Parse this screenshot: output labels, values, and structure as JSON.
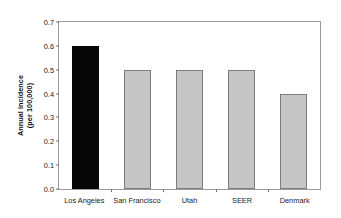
{
  "chart_data": {
    "type": "bar",
    "title": "",
    "xlabel": "",
    "ylabel": "Annual incidence (per 100,000)",
    "ylabel_line1": "Annual incidence",
    "ylabel_line2": "(per 100,000)",
    "categories": [
      "Los Angeles",
      "San Francisco",
      "Utah",
      "SEER",
      "Denmark"
    ],
    "values": [
      0.6,
      0.5,
      0.5,
      0.5,
      0.4
    ],
    "bar_colors": [
      "#070707",
      "#c6c6c6",
      "#c6c6c6",
      "#c6c6c6",
      "#c6c6c6"
    ],
    "ylim": [
      0.0,
      0.7
    ],
    "ytick_values": [
      0.0,
      0.1,
      0.2,
      0.3,
      0.4,
      0.5,
      0.6,
      0.7
    ],
    "ytick_labels": [
      "0.0",
      "0.1",
      "0.2",
      "0.3",
      "0.4",
      "0.5",
      "0.6",
      "0.7"
    ],
    "grid": false,
    "legend": false,
    "legend_position": "none",
    "frame_color": "#9a9a9a",
    "highlight_color": "#070707",
    "series_color": "#c6c6c6"
  }
}
